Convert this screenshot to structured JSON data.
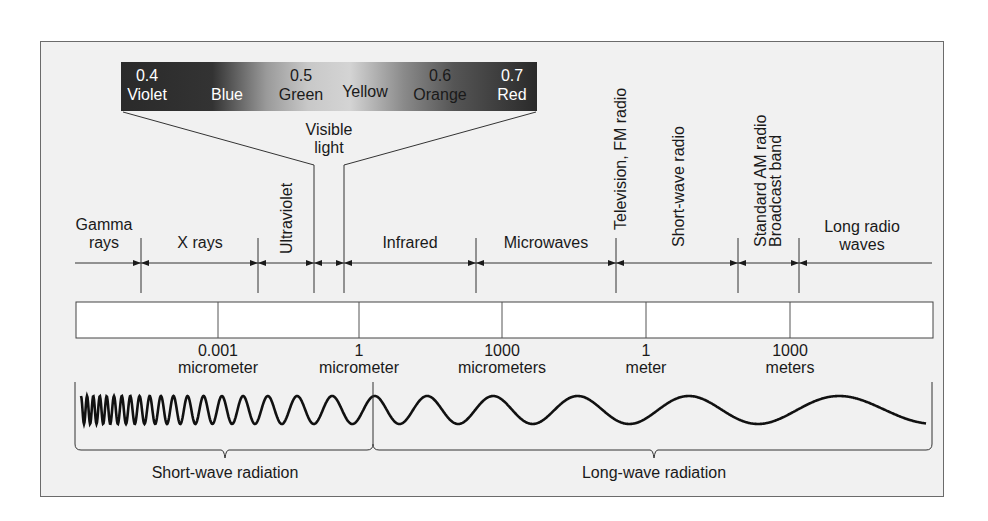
{
  "visible_spectrum": {
    "colors": [
      {
        "value": "0.4",
        "name": "Violet"
      },
      {
        "value": "",
        "name": "Blue"
      },
      {
        "value": "0.5",
        "name": "Green"
      },
      {
        "value": "",
        "name": "Yellow"
      },
      {
        "value": "0.6",
        "name": "Orange"
      },
      {
        "value": "0.7",
        "name": "Red"
      }
    ],
    "label_line1": "Visible",
    "label_line2": "light"
  },
  "bands": [
    {
      "line1": "Gamma",
      "line2": "rays"
    },
    {
      "line1": "X rays",
      "line2": ""
    },
    {
      "line1": "Ultraviolet",
      "line2": "",
      "vertical": true
    },
    {
      "line1": "Infrared",
      "line2": ""
    },
    {
      "line1": "Microwaves",
      "line2": ""
    },
    {
      "line1": "Television, FM radio",
      "line2": "",
      "vertical": true
    },
    {
      "line1": "Short-wave radio",
      "line2": "",
      "vertical": true
    },
    {
      "line1": "Standard AM radio",
      "line2": "Broadcast band",
      "vertical": true
    },
    {
      "line1": "Long radio",
      "line2": "waves"
    }
  ],
  "scale": [
    {
      "value": "0.001",
      "unit": "micrometer"
    },
    {
      "value": "1",
      "unit": "micrometer"
    },
    {
      "value": "1000",
      "unit": "micrometers"
    },
    {
      "value": "1",
      "unit": "meter"
    },
    {
      "value": "1000",
      "unit": "meters"
    }
  ],
  "radiation": {
    "short": "Short-wave radiation",
    "long": "Long-wave radiation"
  }
}
